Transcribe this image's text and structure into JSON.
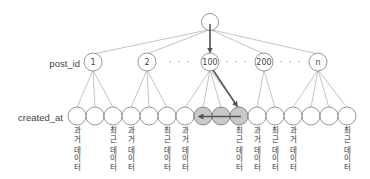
{
  "diagram": {
    "row_labels": {
      "post_id": "post_id",
      "created_at": "created_at"
    },
    "root": {
      "x": 210,
      "y": 22,
      "label": ""
    },
    "level1": [
      {
        "id": "n1",
        "x": 93,
        "label": "1"
      },
      {
        "id": "n2",
        "x": 147,
        "label": "2"
      },
      {
        "id": "n100",
        "x": 210,
        "label": "100"
      },
      {
        "id": "n200",
        "x": 264,
        "label": "200"
      },
      {
        "id": "nn",
        "x": 318,
        "label": "n"
      }
    ],
    "ellipsis": [
      {
        "x": 180,
        "text": "· · ·"
      },
      {
        "x": 237,
        "text": "· · ·"
      },
      {
        "x": 291,
        "text": "· · ·"
      }
    ],
    "leaves": [
      {
        "x": 77,
        "parent": 0,
        "highlight": false,
        "label": "과거 데이터"
      },
      {
        "x": 95,
        "parent": 0,
        "highlight": false,
        "label": ""
      },
      {
        "x": 113,
        "parent": 0,
        "highlight": false,
        "label": "최근 데이터"
      },
      {
        "x": 131,
        "parent": 1,
        "highlight": false,
        "label": "과거 데이터"
      },
      {
        "x": 149,
        "parent": 1,
        "highlight": false,
        "label": ""
      },
      {
        "x": 167,
        "parent": 1,
        "highlight": false,
        "label": "최근 데이터"
      },
      {
        "x": 185,
        "parent": 2,
        "highlight": false,
        "label": "과거 데이터"
      },
      {
        "x": 203,
        "parent": 2,
        "highlight": true,
        "label": ""
      },
      {
        "x": 221,
        "parent": 2,
        "highlight": true,
        "label": ""
      },
      {
        "x": 239,
        "parent": 2,
        "highlight": true,
        "label": "최근 데이터"
      },
      {
        "x": 257,
        "parent": 3,
        "highlight": false,
        "label": "과거 데이터"
      },
      {
        "x": 275,
        "parent": 3,
        "highlight": false,
        "label": "최근 데이터"
      },
      {
        "x": 293,
        "parent": 4,
        "highlight": false,
        "label": "과거 데이터"
      },
      {
        "x": 311,
        "parent": 4,
        "highlight": false,
        "label": ""
      },
      {
        "x": 329,
        "parent": 4,
        "highlight": false,
        "label": ""
      },
      {
        "x": 347,
        "parent": 4,
        "highlight": false,
        "label": "최근 데이터"
      }
    ],
    "search_path": {
      "from_root_to": "100",
      "from_node_to_leaf_index": 9,
      "scan_direction": "left",
      "scan_from_leaf_index": 9,
      "scan_to_leaf_index": 7
    },
    "colors": {
      "edge": "#b5b5b5",
      "node_stroke": "#8a8a8a",
      "highlight_fill": "#c8c8c8",
      "arrow": "#555555"
    }
  }
}
